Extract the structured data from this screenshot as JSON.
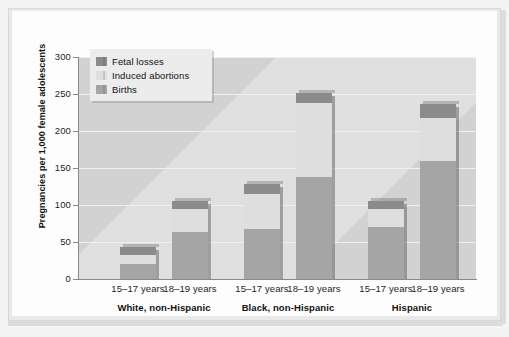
{
  "chart_data": {
    "type": "bar",
    "stacked": true,
    "title": "",
    "xlabel": "",
    "ylabel": "Pregnancies per 1,000 female adolescents",
    "ylim": [
      0,
      300
    ],
    "yticks": [
      0,
      50,
      100,
      150,
      200,
      250,
      300
    ],
    "grid": true,
    "legend_position": "top-left-inside",
    "categories": [
      "15–17 years",
      "18–19 years",
      "15–17 years",
      "18–19 years",
      "15–17 years",
      "18–19 years"
    ],
    "groups": [
      {
        "label": "White, non-Hispanic",
        "categories": [
          "15–17 years",
          "18–19 years"
        ]
      },
      {
        "label": "Black, non-Hispanic",
        "categories": [
          "15–17 years",
          "18–19 years"
        ]
      },
      {
        "label": "Hispanic",
        "categories": [
          "15–17 years",
          "18–19 years"
        ]
      }
    ],
    "series": [
      {
        "name": "Births",
        "color": "#a5a5a5",
        "values": [
          20,
          63,
          67,
          138,
          70,
          159
        ]
      },
      {
        "name": "Induced abortions",
        "color": "#dedede",
        "values": [
          13,
          32,
          48,
          100,
          24,
          59
        ]
      },
      {
        "name": "Fetal losses",
        "color": "#8b8b8b",
        "values": [
          10,
          10,
          14,
          14,
          11,
          19
        ]
      }
    ],
    "totals": [
      43,
      105,
      129,
      252,
      105,
      237
    ],
    "legend": [
      {
        "label": "Fetal losses",
        "color": "#8b8b8b"
      },
      {
        "label": "Induced abortions",
        "color": "#dedede"
      },
      {
        "label": "Births",
        "color": "#a5a5a5"
      }
    ]
  },
  "colors": {
    "fetal_losses": "#8b8b8b",
    "induced_abortions": "#dedede",
    "births": "#a5a5a5",
    "plot_background": "#d2d2d2",
    "card_background": "#fdfdfd",
    "frame": "#e9e9e9",
    "gridline": "#f0f0f0",
    "axis": "#888888",
    "text": "#1d1d1d"
  },
  "axis": {
    "y": {
      "label": "Pregnancies per 1,000 female adolescents",
      "ticks": [
        "300",
        "250",
        "200",
        "150",
        "100",
        "50",
        "0"
      ]
    }
  },
  "bars": [
    {
      "name": "white-15-17",
      "births": 20,
      "induced": 13,
      "fetal": 10,
      "total": 43
    },
    {
      "name": "white-18-19",
      "births": 63,
      "induced": 32,
      "fetal": 10,
      "total": 105
    },
    {
      "name": "black-15-17",
      "births": 67,
      "induced": 48,
      "fetal": 14,
      "total": 129
    },
    {
      "name": "black-18-19",
      "births": 138,
      "induced": 100,
      "fetal": 14,
      "total": 252
    },
    {
      "name": "hispanic-15-17",
      "births": 70,
      "induced": 24,
      "fetal": 11,
      "total": 105
    },
    {
      "name": "hispanic-18-19",
      "births": 159,
      "induced": 59,
      "fetal": 19,
      "total": 237
    }
  ]
}
